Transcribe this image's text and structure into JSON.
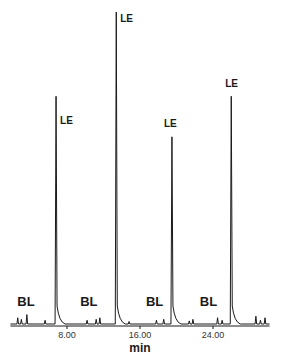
{
  "chart_data": {
    "type": "line",
    "title": "",
    "xlabel": "min",
    "ylabel": "",
    "xlim": [
      1.8,
      30.2
    ],
    "xticks": [
      8,
      16,
      24
    ],
    "xtick_labels": [
      "8.00",
      "16.00",
      "24.00"
    ],
    "grid": false,
    "legend": null,
    "series": [
      {
        "name": "chromatogram",
        "peaks": [
          {
            "x": 6.8,
            "relative_height": 0.73,
            "label": "LE"
          },
          {
            "x": 13.4,
            "relative_height": 1.0,
            "label": "LE"
          },
          {
            "x": 19.5,
            "relative_height": 0.6,
            "label": "LE"
          },
          {
            "x": 26.0,
            "relative_height": 0.73,
            "label": "LE"
          }
        ],
        "minor_peaks": [
          {
            "x": 2.6,
            "relative_height": 0.02
          },
          {
            "x": 3.0,
            "relative_height": 0.015
          },
          {
            "x": 3.6,
            "relative_height": 0.03
          },
          {
            "x": 5.6,
            "relative_height": 0.012
          },
          {
            "x": 10.2,
            "relative_height": 0.012
          },
          {
            "x": 11.2,
            "relative_height": 0.015
          },
          {
            "x": 11.6,
            "relative_height": 0.02
          },
          {
            "x": 14.8,
            "relative_height": 0.008
          },
          {
            "x": 17.8,
            "relative_height": 0.012
          },
          {
            "x": 18.6,
            "relative_height": 0.015
          },
          {
            "x": 21.4,
            "relative_height": 0.01
          },
          {
            "x": 21.8,
            "relative_height": 0.015
          },
          {
            "x": 24.5,
            "relative_height": 0.02
          },
          {
            "x": 25.0,
            "relative_height": 0.012
          },
          {
            "x": 28.7,
            "relative_height": 0.025
          },
          {
            "x": 29.2,
            "relative_height": 0.012
          },
          {
            "x": 29.7,
            "relative_height": 0.02
          }
        ]
      }
    ],
    "annotations": [
      {
        "text": "BL",
        "x": 3.5
      },
      {
        "text": "BL",
        "x": 10.4
      },
      {
        "text": "BL",
        "x": 17.6
      },
      {
        "text": "BL",
        "x": 23.5
      }
    ]
  }
}
